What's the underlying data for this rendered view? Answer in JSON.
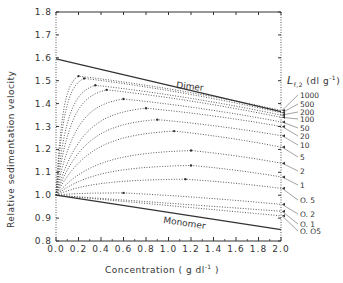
{
  "chart_data": {
    "type": "line",
    "title": "",
    "xlabel": "Concentration ( g dl⁻¹ )",
    "ylabel": "Relative sedimentation velocity",
    "xlim": [
      0.0,
      2.0
    ],
    "ylim": [
      0.8,
      1.8
    ],
    "x_ticks": [
      "0.0",
      "0.2",
      "0.4",
      "0.6",
      "0.8",
      "1.0",
      "1.2",
      "1.4",
      "1.6",
      "1.8",
      "2.0"
    ],
    "y_ticks": [
      "0.8",
      "0.9",
      "1.0",
      "1.1",
      "1.2",
      "1.3",
      "1.4",
      "1.5",
      "1.6",
      "1.7",
      "1.8"
    ],
    "grid": false,
    "legend_title": "L",
    "legend_title_sub": "f,2",
    "legend_title_units": "(dl g⁻¹)",
    "legend_position": "right",
    "boundary_lines": [
      {
        "name": "Dimer",
        "style": "solid",
        "x": [
          0.0,
          2.0
        ],
        "y": [
          1.595,
          1.365
        ]
      },
      {
        "name": "Monomer",
        "style": "solid",
        "x": [
          0.0,
          2.0
        ],
        "y": [
          1.0,
          0.85
        ]
      }
    ],
    "series": [
      {
        "name": "1000",
        "style": "dotted",
        "start": 1.0,
        "peak_x": 0.2,
        "peak_y": 1.52,
        "end": 1.37
      },
      {
        "name": "500",
        "style": "dotted",
        "start": 1.0,
        "peak_x": 0.25,
        "peak_y": 1.51,
        "end": 1.36
      },
      {
        "name": "200",
        "style": "dotted",
        "start": 1.0,
        "peak_x": 0.35,
        "peak_y": 1.48,
        "end": 1.35
      },
      {
        "name": "100",
        "style": "dotted",
        "start": 1.0,
        "peak_x": 0.45,
        "peak_y": 1.46,
        "end": 1.34
      },
      {
        "name": "50",
        "style": "dotted",
        "start": 1.0,
        "peak_x": 0.6,
        "peak_y": 1.42,
        "end": 1.32
      },
      {
        "name": "20",
        "style": "dotted",
        "start": 1.0,
        "peak_x": 0.8,
        "peak_y": 1.38,
        "end": 1.3
      },
      {
        "name": "10",
        "style": "dotted",
        "start": 1.0,
        "peak_x": 0.9,
        "peak_y": 1.33,
        "end": 1.26
      },
      {
        "name": "5",
        "style": "dotted",
        "start": 1.0,
        "peak_x": 1.05,
        "peak_y": 1.28,
        "end": 1.21
      },
      {
        "name": "2",
        "style": "dotted",
        "start": 1.0,
        "peak_x": 1.2,
        "peak_y": 1.195,
        "end": 1.14
      },
      {
        "name": "1",
        "style": "dotted",
        "start": 1.0,
        "peak_x": 1.2,
        "peak_y": 1.13,
        "end": 1.08
      },
      {
        "name": "0.5",
        "style": "dotted",
        "start": 1.0,
        "peak_x": 1.15,
        "peak_y": 1.07,
        "end": 1.03
      },
      {
        "name": "0.2",
        "style": "dotted",
        "start": 1.0,
        "peak_x": 0.6,
        "peak_y": 1.01,
        "end": 0.96
      },
      {
        "name": "0.1",
        "style": "dotted",
        "start": 1.0,
        "peak_x": 0.0,
        "peak_y": 1.0,
        "end": 0.93
      },
      {
        "name": "0.05",
        "style": "dotted",
        "start": 1.0,
        "peak_x": 0.0,
        "peak_y": 1.0,
        "end": 0.91
      }
    ],
    "annotations": [
      "Dimer",
      "Monomer"
    ]
  },
  "labels": {
    "xlabel": "Concentration ( g dl",
    "xlabel_sup": "-1",
    "xlabel_end": ")",
    "ylabel": "Relative sedimentation velocity",
    "legend_title": "L",
    "legend_sub": "f,2",
    "legend_units": "(dl g",
    "legend_units_sup": "-1",
    "legend_units_end": ")",
    "dimer": "Dimer",
    "monomer": "Monomer"
  }
}
